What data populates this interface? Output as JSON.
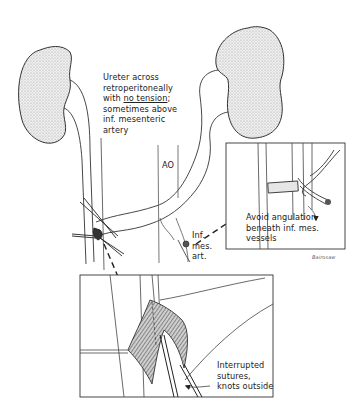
{
  "figure": {
    "labels": {
      "ureter_note": {
        "line1": "Ureter across",
        "line2": "retroperitoneally",
        "line3_prefix": "with ",
        "line3_emph": "no tension",
        "line3_suffix": ";",
        "line4": "sometimes above",
        "line5": "inf. mesenteric",
        "line6": "artery"
      },
      "aorta": "AO",
      "inf_mes_art": {
        "line1": "Inf.",
        "line2": "mes.",
        "line3": "art."
      },
      "angulation_note": {
        "line1": "Avoid angulation",
        "line2": "beneath inf. mes.",
        "line3": "vessels"
      },
      "suture_note": {
        "line1": "Interrupted",
        "line2": "sutures,",
        "line3": "knots outside"
      },
      "signature": "Bairosaw"
    },
    "colors": {
      "ink": "#222222",
      "stipple": "#d6d6d6",
      "background": "#ffffff"
    }
  }
}
